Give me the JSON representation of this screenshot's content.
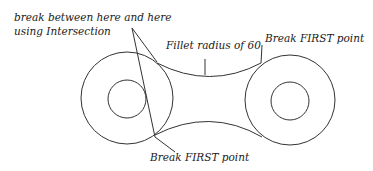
{
  "diagram": {
    "labels": {
      "intersection_line1": "break between here and here",
      "intersection_line2": "using Intersection",
      "fillet": "Fillet radius of 60",
      "break_top": "Break  FIRST point",
      "break_bottom": "Break  FIRST point"
    },
    "geometry": {
      "left_outer_circle": {
        "cx": 127,
        "cy": 98,
        "r": 46
      },
      "left_inner_circle": {
        "cx": 127,
        "cy": 99,
        "r": 19
      },
      "right_outer_circle": {
        "cx": 290,
        "cy": 100,
        "r": 45
      },
      "right_inner_circle": {
        "cx": 290,
        "cy": 101,
        "r": 19
      },
      "fillet_radius": 60
    },
    "colors": {
      "stroke": "#333333",
      "text": "#1a1a1a",
      "background": "#ffffff"
    }
  }
}
